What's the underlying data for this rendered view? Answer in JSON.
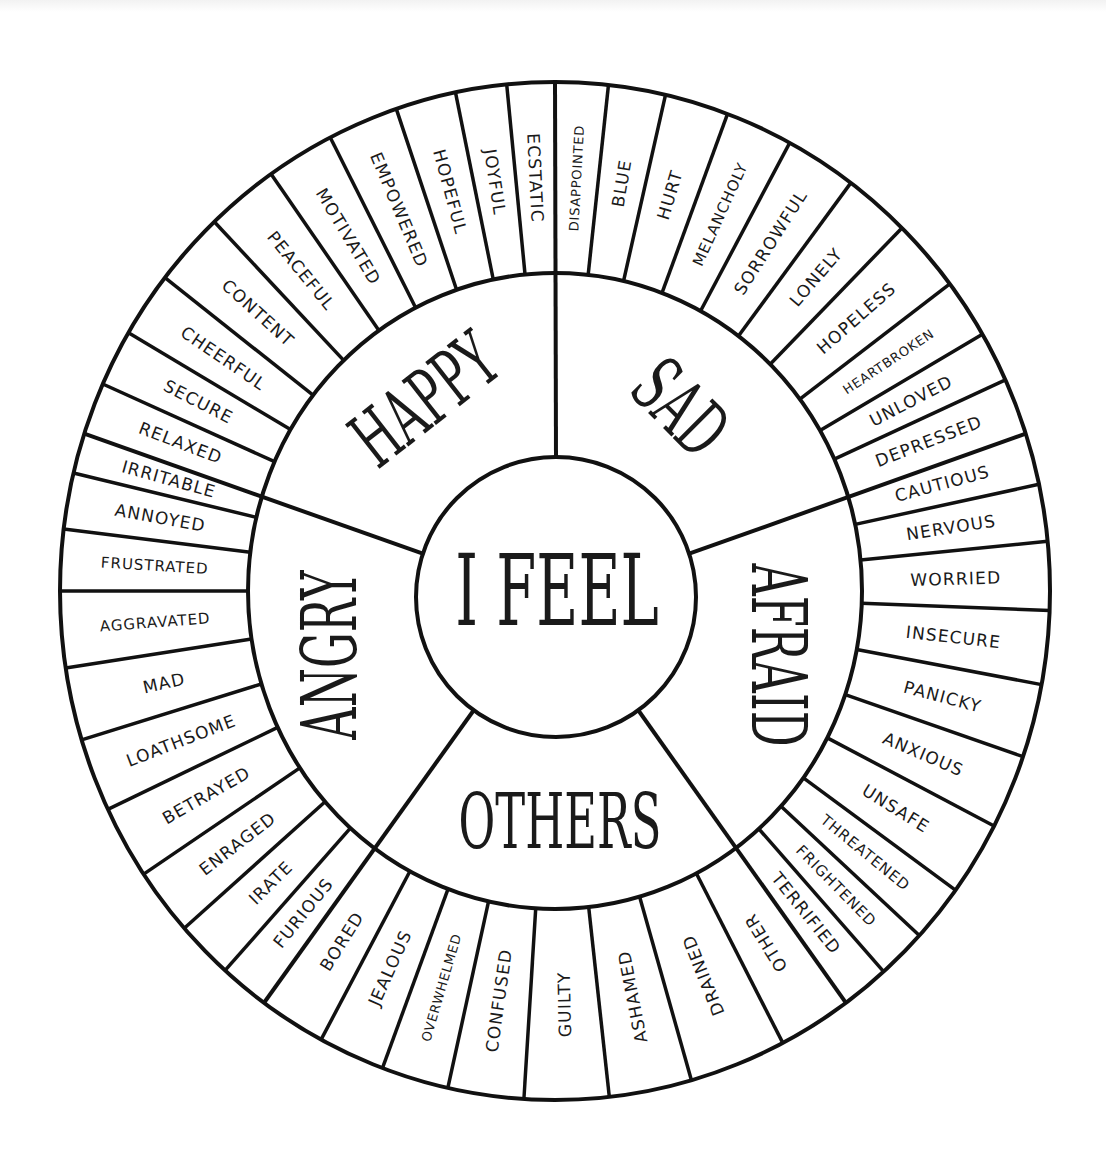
{
  "wheel": {
    "center_label": "I FEEL",
    "geometry": {
      "cx": 555,
      "cy": 591,
      "outer_rx": 495,
      "outer_ry": 509,
      "ring_rx": 307,
      "ring_ry": 318,
      "center_r": 140
    },
    "categories": [
      {
        "name": "SAD",
        "start": 0,
        "end": 72,
        "label_pos": [
          680,
          408
        ],
        "label_rot": 45,
        "boundaries": [
          6.2,
          12.9,
          20.4,
          28.3,
          36.7,
          44.5,
          52.9,
          59.7,
          65.5
        ],
        "items": [
          "DISAPPOINTED",
          "BLUE",
          "HURT",
          "MELANCHOLY",
          "SORROWFUL",
          "LONELY",
          "HOPELESS",
          "HEARTBROKEN",
          "UNLOVED",
          "DEPRESSED"
        ]
      },
      {
        "name": "AFRAID",
        "start": 72,
        "end": 144,
        "label_pos": [
          778,
          655
        ],
        "label_rot": 90,
        "boundaries": [
          77.9,
          84.4,
          92.2,
          100.6,
          109,
          117.5,
          126,
          132.6,
          138.4
        ],
        "items": [
          "CAUTIOUS",
          "NERVOUS",
          "WORRIED",
          "INSECURE",
          "PANICKY",
          "ANXIOUS",
          "UNSAFE",
          "THREATENED",
          "FRIGHTENED",
          "TERRIFIED"
        ]
      },
      {
        "name": "OTHERS",
        "start": 144,
        "end": 216,
        "label_pos": [
          560,
          822
        ],
        "label_rot": 0,
        "boundaries": [
          152.6,
          164,
          173.7,
          183.6,
          192.5,
          200.4,
          208.2
        ],
        "items": [
          "OTHER",
          "DRAINED",
          "ASHAMED",
          "GUILTY",
          "CONFUSED",
          "OVERWHELMED",
          "JEALOUS",
          "BORED"
        ]
      },
      {
        "name": "ANGRY",
        "start": 216,
        "end": 288,
        "label_pos": [
          330,
          655
        ],
        "label_rot": -90,
        "boundaries": [
          221.8,
          228.5,
          236.2,
          244.6,
          253,
          261.3,
          270,
          277,
          283.4
        ],
        "items": [
          "FURIOUS",
          "IRATE",
          "ENRAGED",
          "BETRAYED",
          "LOATHSOME",
          "MAD",
          "AGGRAVATED",
          "FRUSTRATED",
          "ANNOYED",
          "IRRITABLE"
        ]
      },
      {
        "name": "HAPPY",
        "start": 288,
        "end": 360,
        "label_pos": [
          425,
          400
        ],
        "label_rot": -38,
        "boundaries": [
          294,
          300.5,
          308,
          316.5,
          325,
          333,
          341.3,
          348.4,
          354.4
        ],
        "items": [
          "RELAXED",
          "SECURE",
          "CHEERFUL",
          "CONTENT",
          "PEACEFUL",
          "MOTIVATED",
          "EMPOWERED",
          "HOPEFUL",
          "JOYFUL",
          "ECSTATIC"
        ]
      }
    ],
    "colors": {
      "line": "#111111",
      "text": "#1a1a1a",
      "background": "#ffffff"
    }
  }
}
